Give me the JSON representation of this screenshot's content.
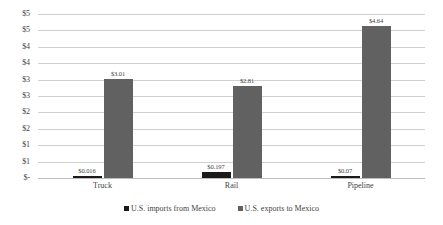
{
  "chart_data": {
    "type": "bar",
    "title": "",
    "subtitle": "",
    "xlabel": "",
    "ylabel": "",
    "categories": [
      "Truck",
      "Rail",
      "Pipeline"
    ],
    "series": [
      {
        "name": "U.S. imports from Mexico",
        "color": "#1a1a1a",
        "values": [
          0.016,
          0.197,
          0.07
        ],
        "labels": [
          "$0.016",
          "$0.197",
          "$0.07"
        ]
      },
      {
        "name": "U.S. exports to Mexico",
        "color": "#616161",
        "values": [
          3.01,
          2.81,
          4.64
        ],
        "labels": [
          "$3.01",
          "$2.81",
          "$4.64"
        ]
      }
    ],
    "ylim": [
      0,
      5.0
    ],
    "ytick_values": [
      5.0,
      4.5,
      4.0,
      3.5,
      3.0,
      2.5,
      2.0,
      1.5,
      1.0,
      0.5,
      0
    ],
    "ytick_labels": [
      "$5",
      "$5",
      "$4",
      "$4",
      "$3",
      "$3",
      "$2",
      "$2",
      "$1",
      "$1",
      "$-"
    ],
    "grid": true,
    "grid_axis": "y",
    "legend": true,
    "legend_position": "bottom",
    "background_color": "#ffffff",
    "gridline_color": "#d0d0d0"
  },
  "legend": {
    "items": [
      {
        "label": "U.S. imports from Mexico"
      },
      {
        "label": "U.S. exports to Mexico"
      }
    ]
  }
}
